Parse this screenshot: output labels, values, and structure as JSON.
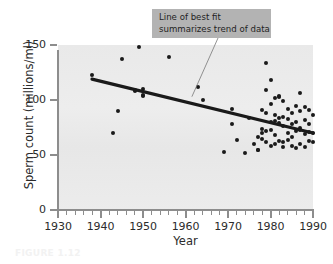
{
  "figure": {
    "caption": "FIGURE 1.12"
  },
  "callout": {
    "name": "line-of-best-fit-callout",
    "line1": "Line of best fit",
    "line2": "summarizes trend of data",
    "box_color": "#b3b3b3",
    "text_color": "#1f1f1f"
  },
  "chart_data": {
    "type": "scatter",
    "title": "",
    "subtitle": "",
    "xlabel": "Year",
    "ylabel": "Sperm count (millions/ml)",
    "xlim": [
      1930,
      1990
    ],
    "ylim": [
      0,
      150
    ],
    "xticks": [
      1930,
      1940,
      1950,
      1960,
      1970,
      1980,
      1990
    ],
    "xticklabels": [
      "1930",
      "1940",
      "1950",
      "1960",
      "1970",
      "1980",
      "1990"
    ],
    "x_minor_tick_interval": 2,
    "yticks": [
      0,
      50,
      100,
      150
    ],
    "yticklabels": [
      "0",
      "50",
      "100",
      "150"
    ],
    "grid": false,
    "legend": null,
    "plot_background": "#ebebeb",
    "point_color": "#1a1a1a",
    "line_color": "#1a1a1a",
    "annotations": [
      {
        "text": "Line of best fit summarizes trend of data",
        "anchor_x": 1961.5,
        "anchor_y": 103
      }
    ],
    "series": [
      {
        "name": "Sperm count observations",
        "type": "scatter",
        "points": [
          [
            1938,
            123
          ],
          [
            1943,
            70
          ],
          [
            1944,
            90
          ],
          [
            1945,
            137
          ],
          [
            1948,
            109
          ],
          [
            1948,
            108
          ],
          [
            1949,
            148
          ],
          [
            1950,
            110
          ],
          [
            1950,
            105
          ],
          [
            1950,
            104
          ],
          [
            1956,
            139
          ],
          [
            1963,
            112
          ],
          [
            1964,
            100
          ],
          [
            1969,
            53
          ],
          [
            1971,
            92
          ],
          [
            1971,
            78
          ],
          [
            1972,
            64
          ],
          [
            1974,
            52
          ],
          [
            1975,
            84
          ],
          [
            1976,
            60
          ],
          [
            1977,
            55
          ],
          [
            1977,
            55
          ],
          [
            1977,
            66
          ],
          [
            1978,
            91
          ],
          [
            1978,
            74
          ],
          [
            1978,
            70
          ],
          [
            1978,
            65
          ],
          [
            1979,
            134
          ],
          [
            1979,
            109
          ],
          [
            1979,
            88
          ],
          [
            1979,
            72
          ],
          [
            1979,
            62
          ],
          [
            1980,
            118
          ],
          [
            1980,
            96
          ],
          [
            1980,
            80
          ],
          [
            1980,
            73
          ],
          [
            1980,
            58
          ],
          [
            1981,
            102
          ],
          [
            1981,
            86
          ],
          [
            1981,
            81
          ],
          [
            1981,
            68
          ],
          [
            1981,
            60
          ],
          [
            1982,
            104
          ],
          [
            1982,
            103
          ],
          [
            1982,
            84
          ],
          [
            1982,
            79
          ],
          [
            1982,
            63
          ],
          [
            1983,
            99
          ],
          [
            1983,
            85
          ],
          [
            1983,
            76
          ],
          [
            1983,
            62
          ],
          [
            1983,
            57
          ],
          [
            1984,
            92
          ],
          [
            1984,
            83
          ],
          [
            1984,
            70
          ],
          [
            1984,
            64
          ],
          [
            1985,
            88
          ],
          [
            1985,
            78
          ],
          [
            1985,
            66
          ],
          [
            1985,
            58
          ],
          [
            1986,
            95
          ],
          [
            1986,
            80
          ],
          [
            1986,
            72
          ],
          [
            1986,
            56
          ],
          [
            1987,
            106
          ],
          [
            1987,
            90
          ],
          [
            1987,
            75
          ],
          [
            1987,
            73
          ],
          [
            1987,
            60
          ],
          [
            1988,
            94
          ],
          [
            1988,
            82
          ],
          [
            1988,
            69
          ],
          [
            1988,
            57
          ],
          [
            1989,
            91
          ],
          [
            1989,
            78
          ],
          [
            1989,
            71
          ],
          [
            1989,
            63
          ],
          [
            1990,
            86
          ],
          [
            1990,
            70
          ],
          [
            1990,
            62
          ]
        ]
      },
      {
        "name": "Line of best fit",
        "type": "line",
        "points": [
          [
            1938,
            119
          ],
          [
            1990,
            70
          ]
        ]
      }
    ]
  }
}
